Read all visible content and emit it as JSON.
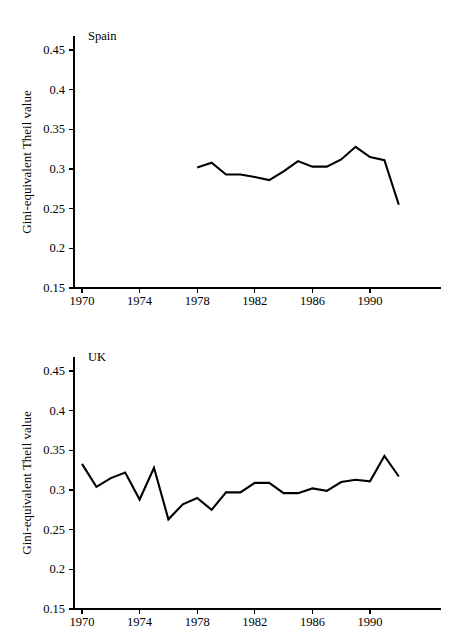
{
  "figure": {
    "background": "#ffffff",
    "line_color": "#000000",
    "axis_color": "#000000"
  },
  "panels": [
    {
      "name": "spain-panel",
      "title": "Spain",
      "ylabel": "Gini-equivalent Theil value",
      "ytick_labels": [
        "0.45",
        "0.4",
        "0.35",
        "0.3",
        "0.25",
        "0.2",
        "0.15"
      ],
      "xtick_labels": [
        "1970",
        "1974",
        "1978",
        "1982",
        "1986",
        "1990"
      ]
    },
    {
      "name": "uk-panel",
      "title": "UK",
      "ylabel": "Gini-equivalent Theil value",
      "ytick_labels": [
        "0.45",
        "0.4",
        "0.35",
        "0.3",
        "0.25",
        "0.2",
        "0.15"
      ],
      "xtick_labels": [
        "1970",
        "1974",
        "1978",
        "1982",
        "1986",
        "1990"
      ]
    }
  ],
  "chart_data": [
    {
      "type": "line",
      "title": "Spain",
      "xlabel": "",
      "ylabel": "Gini-equivalent Theil value",
      "xlim": [
        1970,
        1992
      ],
      "ylim": [
        0.15,
        0.47
      ],
      "xticks": [
        1970,
        1974,
        1978,
        1982,
        1986,
        1990
      ],
      "yticks": [
        0.15,
        0.2,
        0.25,
        0.3,
        0.35,
        0.4,
        0.45
      ],
      "grid": false,
      "legend": "none",
      "series": [
        {
          "name": "Spain",
          "x": [
            1978,
            1979,
            1980,
            1981,
            1982,
            1983,
            1984,
            1985,
            1986,
            1987,
            1988,
            1989,
            1990,
            1991,
            1992
          ],
          "values": [
            0.302,
            0.308,
            0.293,
            0.293,
            0.29,
            0.286,
            0.297,
            0.31,
            0.303,
            0.303,
            0.312,
            0.328,
            0.315,
            0.311,
            0.255
          ]
        }
      ]
    },
    {
      "type": "line",
      "title": "UK",
      "xlabel": "",
      "ylabel": "Gini-equivalent Theil value",
      "xlim": [
        1970,
        1992
      ],
      "ylim": [
        0.15,
        0.47
      ],
      "xticks": [
        1970,
        1974,
        1978,
        1982,
        1986,
        1990
      ],
      "yticks": [
        0.15,
        0.2,
        0.25,
        0.3,
        0.35,
        0.4,
        0.45
      ],
      "grid": false,
      "legend": "none",
      "series": [
        {
          "name": "UK",
          "x": [
            1970,
            1971,
            1972,
            1973,
            1974,
            1975,
            1976,
            1977,
            1978,
            1979,
            1980,
            1981,
            1982,
            1983,
            1984,
            1985,
            1986,
            1987,
            1988,
            1989,
            1990,
            1991,
            1992
          ],
          "values": [
            0.333,
            0.304,
            0.315,
            0.322,
            0.288,
            0.328,
            0.263,
            0.282,
            0.29,
            0.275,
            0.297,
            0.297,
            0.309,
            0.309,
            0.296,
            0.296,
            0.302,
            0.299,
            0.31,
            0.313,
            0.311,
            0.343,
            0.317
          ]
        }
      ]
    }
  ]
}
